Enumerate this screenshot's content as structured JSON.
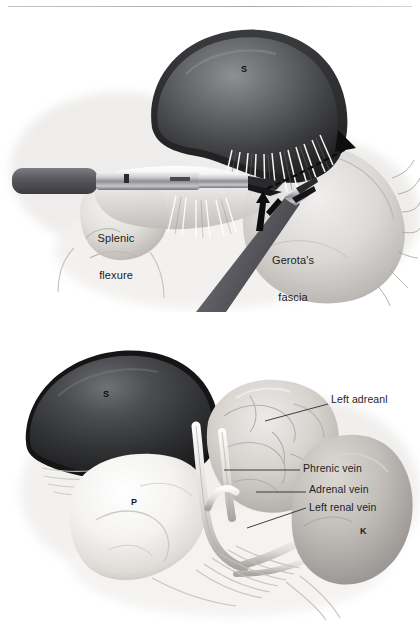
{
  "figure": {
    "style": "grayscale medical illustration",
    "width": 420,
    "height": 624,
    "background_color": "#ffffff",
    "ink_color": "#201f1f",
    "panel_count": 2
  },
  "panels": [
    {
      "id": "panel-top",
      "name": "mobilization-of-splenic-flexure",
      "caption": "",
      "labels": [
        {
          "id": "spleen-initial",
          "text": "S",
          "kind": "organ-key",
          "x": 244,
          "y": 70,
          "on_dark": true
        },
        {
          "id": "splenic-flexure",
          "text_line1": "Splenic",
          "text_line2": "flexure",
          "kind": "inset",
          "x": 115,
          "y": 213
        },
        {
          "id": "gerotas-fascia",
          "text_line1": "Gerota's",
          "text_line2": "fascia",
          "kind": "inset",
          "x": 290,
          "y": 235
        }
      ],
      "annotations": [
        {
          "id": "dissection-plane",
          "kind": "dashed-line-with-arrowhead",
          "description": "dashed incision line along lateral attachment with solid arrowhead pointing up-right"
        },
        {
          "id": "retraction-arrow",
          "kind": "solid-arrow",
          "description": "bent solid arrow indicating upward retraction at grasper tip"
        }
      ],
      "instruments": [
        {
          "id": "laparoscopic-shaft-upper",
          "kind": "grasper",
          "description": "horizontal instrument entering from left with dark handle and shiny shaft"
        },
        {
          "id": "laparoscopic-shaft-lower",
          "kind": "grasper",
          "description": "angled instrument entering from lower left toward the dissection plane"
        }
      ]
    },
    {
      "id": "panel-bottom",
      "name": "exposed-left-adrenal-and-venous-anatomy",
      "caption": "",
      "labels": [
        {
          "id": "spleen",
          "text": "S",
          "kind": "organ-key",
          "x": 106,
          "y": 395,
          "on_dark": true
        },
        {
          "id": "pancreas",
          "text": "P",
          "kind": "organ-key",
          "x": 134,
          "y": 503,
          "on_dark": false
        },
        {
          "id": "kidney",
          "text": "K",
          "kind": "organ-key",
          "x": 363,
          "y": 532,
          "on_dark": false
        }
      ],
      "callouts": [
        {
          "id": "left-adrenal",
          "text": "Left adreanl",
          "x": 332,
          "y": 400,
          "leader_from": [
            265,
            421
          ],
          "leader_to": [
            328,
            404
          ]
        },
        {
          "id": "phrenic-vein",
          "text": "Phrenic vein",
          "x": 304,
          "y": 464,
          "leader_from": [
            224,
            470
          ],
          "leader_to": [
            300,
            470
          ]
        },
        {
          "id": "adrenal-vein",
          "text": "Adrenal vein",
          "x": 310,
          "y": 483,
          "leader_from": [
            256,
            492
          ],
          "leader_to": [
            306,
            492
          ]
        },
        {
          "id": "left-renal-vein",
          "text": "Left renal vein",
          "x": 310,
          "y": 501,
          "leader_from": [
            247,
            528
          ],
          "leader_to": [
            306,
            508
          ]
        }
      ]
    }
  ],
  "legend": {
    "organ_keys": [
      {
        "key": "S",
        "meaning": "Spleen"
      },
      {
        "key": "P",
        "meaning": "Pancreas"
      },
      {
        "key": "K",
        "meaning": "Kidney"
      }
    ]
  },
  "palette": {
    "page_background": "#ffffff",
    "spleen_dark": "#2d2d2f",
    "spleen_mid": "#4f5052",
    "spleen_highlight": "#8e9093",
    "tissue_light": "#f2f1ef",
    "tissue_mid": "#d6d4d1",
    "tissue_shadow": "#a8a6a3",
    "adrenal_fill": "#c9c6c2",
    "kidney_fill": "#bdbab7",
    "instrument_dark": "#55555a",
    "instrument_shine": "#e9e9ea",
    "leader_line": "#2a2a2a",
    "text": "#201f1f"
  }
}
